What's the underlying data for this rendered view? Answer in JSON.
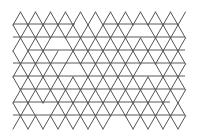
{
  "figure": {
    "width": 199,
    "height": 137,
    "background": "#ffffff",
    "stroke_color": "#555555"
  },
  "lattice": {
    "origin_x": 13,
    "top_y": 12,
    "row_height": 13,
    "triangle_width": 15,
    "rows": 9,
    "cols": 12
  },
  "horizontal_lines": [
    {
      "y": 24,
      "x1": 13,
      "x2": 75
    },
    {
      "y": 24,
      "x1": 103,
      "x2": 178
    },
    {
      "y": 37,
      "x1": 13,
      "x2": 185
    },
    {
      "y": 50,
      "x1": 28,
      "x2": 185
    },
    {
      "y": 63,
      "x1": 13,
      "x2": 185
    },
    {
      "y": 76,
      "x1": 13,
      "x2": 185
    },
    {
      "y": 89,
      "x1": 20,
      "x2": 185
    },
    {
      "y": 102,
      "x1": 13,
      "x2": 170
    },
    {
      "y": 115,
      "x1": 13,
      "x2": 185
    }
  ],
  "gaps": [
    {
      "cx": 60,
      "cy": 50,
      "r": 9
    },
    {
      "cx": 140,
      "cy": 30,
      "r": 9
    },
    {
      "cx": 75,
      "cy": 70,
      "r": 8
    },
    {
      "cx": 150,
      "cy": 70,
      "r": 8
    },
    {
      "cx": 40,
      "cy": 110,
      "r": 8
    },
    {
      "cx": 120,
      "cy": 122,
      "r": 7
    }
  ]
}
